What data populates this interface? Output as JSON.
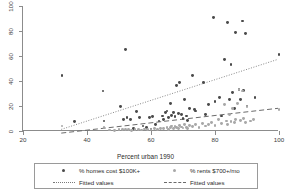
{
  "chart_data": {
    "type": "scatter",
    "title": "",
    "xlabel": "Percent urban 1990",
    "ylabel": "",
    "xlim": [
      20,
      100
    ],
    "ylim": [
      0,
      100
    ],
    "xticks": [
      "20",
      "40",
      "60",
      "80",
      "100"
    ],
    "yticks": [
      "0",
      "20",
      "40",
      "60",
      "80",
      "100"
    ],
    "grid": false,
    "legend_position": "bottom",
    "legend_entries": [
      {
        "label": "% homes cost $100K+",
        "marker": "filled-circle",
        "color": "#4a4a4a"
      },
      {
        "label": "% rents $700+/mo",
        "marker": "filled-circle",
        "color": "#a8a8a8"
      },
      {
        "label": "Fitted values",
        "marker": "dotted-line",
        "color": "#7a7a7a"
      },
      {
        "label": "Fitted values",
        "marker": "dashed-line",
        "color": "#6a6a6a"
      }
    ],
    "series": [
      {
        "name": "% homes cost $100K+",
        "marker": "filled-circle",
        "color": "#4a4a4a",
        "points": [
          [
            32.2,
            44.5
          ],
          [
            36.0,
            7.5
          ],
          [
            45.0,
            32.0
          ],
          [
            45.3,
            8.0
          ],
          [
            50.5,
            19.5
          ],
          [
            52.0,
            65.0
          ],
          [
            51.5,
            9.5
          ],
          [
            52.5,
            10.5
          ],
          [
            53.5,
            9.0
          ],
          [
            54.5,
            2.0
          ],
          [
            55.5,
            15.5
          ],
          [
            56.5,
            10.5
          ],
          [
            57.5,
            4.0
          ],
          [
            58.5,
            3.0
          ],
          [
            59.5,
            11.0
          ],
          [
            60.5,
            11.5
          ],
          [
            60.0,
            1.0
          ],
          [
            61.5,
            5.0
          ],
          [
            62.5,
            8.0
          ],
          [
            63.5,
            12.0
          ],
          [
            64.0,
            9.0
          ],
          [
            64.5,
            14.5
          ],
          [
            65.0,
            16.0
          ],
          [
            65.5,
            10.5
          ],
          [
            66.0,
            22.0
          ],
          [
            66.5,
            12.5
          ],
          [
            67.0,
            15.0
          ],
          [
            67.5,
            11.5
          ],
          [
            68.0,
            36.5
          ],
          [
            68.5,
            14.0
          ],
          [
            69.0,
            39.0
          ],
          [
            69.5,
            13.5
          ],
          [
            70.0,
            10.0
          ],
          [
            70.5,
            25.5
          ],
          [
            71.0,
            12.0
          ],
          [
            71.5,
            8.5
          ],
          [
            72.0,
            18.0
          ],
          [
            73.0,
            44.5
          ],
          [
            73.5,
            17.5
          ],
          [
            74.0,
            16.0
          ],
          [
            76.5,
            38.5
          ],
          [
            77.0,
            13.0
          ],
          [
            78.0,
            21.0
          ],
          [
            79.5,
            90.5
          ],
          [
            80.0,
            23.5
          ],
          [
            81.5,
            27.0
          ],
          [
            82.0,
            12.0
          ],
          [
            83.0,
            57.5
          ],
          [
            84.0,
            86.5
          ],
          [
            84.5,
            25.0
          ],
          [
            85.0,
            53.5
          ],
          [
            85.5,
            31.0
          ],
          [
            86.0,
            18.0
          ],
          [
            86.5,
            78.5
          ],
          [
            87.5,
            33.0
          ],
          [
            88.0,
            25.0
          ],
          [
            88.5,
            88.0
          ],
          [
            89.0,
            32.5
          ],
          [
            89.5,
            78.0
          ],
          [
            90.0,
            20.0
          ],
          [
            92.5,
            27.0
          ],
          [
            100.0,
            61.5
          ]
        ]
      },
      {
        "name": "% rents $700+/mo",
        "marker": "filled-circle",
        "color": "#a8a8a8",
        "points": [
          [
            32.2,
            4.0
          ],
          [
            45.3,
            3.0
          ],
          [
            47.0,
            0.8
          ],
          [
            48.5,
            0.6
          ],
          [
            50.0,
            1.2
          ],
          [
            51.0,
            0.9
          ],
          [
            52.0,
            1.5
          ],
          [
            53.0,
            1.0
          ],
          [
            54.0,
            0.7
          ],
          [
            55.0,
            1.3
          ],
          [
            56.0,
            1.1
          ],
          [
            57.0,
            0.8
          ],
          [
            58.0,
            1.6
          ],
          [
            59.0,
            1.2
          ],
          [
            60.0,
            1.0
          ],
          [
            61.0,
            2.0
          ],
          [
            62.0,
            1.4
          ],
          [
            63.0,
            2.2
          ],
          [
            64.0,
            1.8
          ],
          [
            65.0,
            3.0
          ],
          [
            65.5,
            1.5
          ],
          [
            66.0,
            2.5
          ],
          [
            66.5,
            4.0
          ],
          [
            67.0,
            2.0
          ],
          [
            67.5,
            3.5
          ],
          [
            68.0,
            2.8
          ],
          [
            68.5,
            1.9
          ],
          [
            69.0,
            4.5
          ],
          [
            69.5,
            3.2
          ],
          [
            70.0,
            2.4
          ],
          [
            70.5,
            5.0
          ],
          [
            71.0,
            3.0
          ],
          [
            71.5,
            2.1
          ],
          [
            72.0,
            4.2
          ],
          [
            73.0,
            3.6
          ],
          [
            74.0,
            5.5
          ],
          [
            75.0,
            3.0
          ],
          [
            76.0,
            6.0
          ],
          [
            77.0,
            4.0
          ],
          [
            78.0,
            5.0
          ],
          [
            79.0,
            7.0
          ],
          [
            80.0,
            4.5
          ],
          [
            81.0,
            9.5
          ],
          [
            82.0,
            6.0
          ],
          [
            83.0,
            21.5
          ],
          [
            83.5,
            8.0
          ],
          [
            84.0,
            5.5
          ],
          [
            84.5,
            13.0
          ],
          [
            85.0,
            7.5
          ],
          [
            85.5,
            18.0
          ],
          [
            86.0,
            6.5
          ],
          [
            86.5,
            9.0
          ],
          [
            87.0,
            22.0
          ],
          [
            87.5,
            33.5
          ],
          [
            88.0,
            8.5
          ],
          [
            88.5,
            32.0
          ],
          [
            89.0,
            10.0
          ],
          [
            89.5,
            7.0
          ],
          [
            90.0,
            19.5
          ],
          [
            91.0,
            8.0
          ],
          [
            92.0,
            9.5
          ],
          [
            100.0,
            17.0
          ]
        ]
      }
    ],
    "fitted_lines": [
      {
        "name": "Fitted values",
        "style": "dotted",
        "color": "#7a7a7a",
        "x0": 32.0,
        "y0": 0.5,
        "x1": 100.0,
        "y1": 57.0
      },
      {
        "name": "Fitted values",
        "style": "dashed",
        "color": "#6a6a6a",
        "x0": 32.0,
        "y0": -2.5,
        "x1": 100.0,
        "y1": 17.5
      }
    ]
  }
}
